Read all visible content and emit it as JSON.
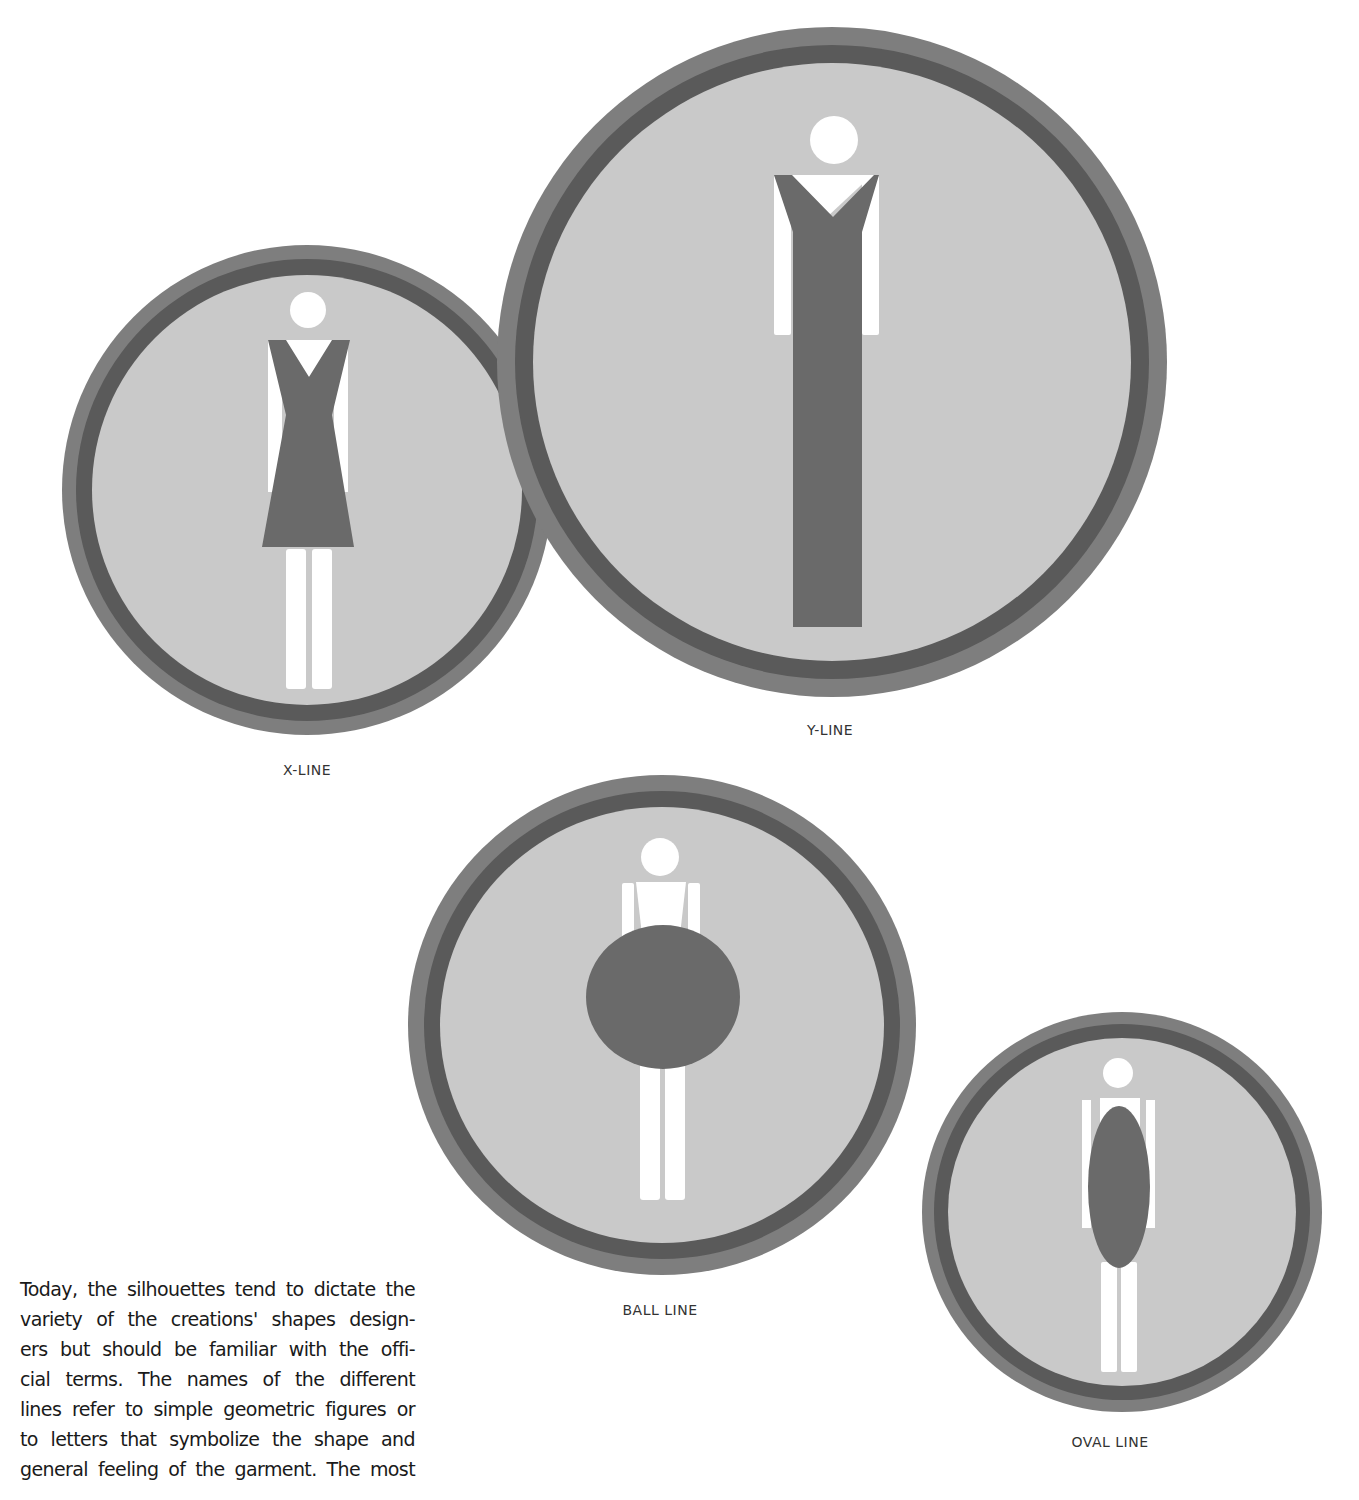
{
  "figures": [
    {
      "id": "x-line",
      "caption": "X-LINE",
      "shape": "A-line dress with V-neck forming an X silhouette",
      "center": [
        307,
        490
      ],
      "radius": 245,
      "caption_pos": [
        307,
        770
      ]
    },
    {
      "id": "y-line",
      "caption": "Y-LINE",
      "shape": "V-neck top flaring into a long straight column forming a Y",
      "center": [
        832,
        362
      ],
      "radius": 335,
      "caption_pos": [
        830,
        730
      ]
    },
    {
      "id": "ball-line",
      "caption": "BALL LINE",
      "shape": "large round circle body over torso",
      "center": [
        660,
        1025
      ],
      "radius": 255,
      "caption_pos": [
        660,
        1308
      ]
    },
    {
      "id": "oval-line",
      "caption": "OVAL LINE",
      "shape": "vertical elongated oval body",
      "center": [
        1122,
        1215
      ],
      "radius": 200,
      "caption_pos": [
        1110,
        1440
      ]
    }
  ],
  "colors": {
    "outer_band": "#7e7e7e",
    "dark_ring": "#5a5a5a",
    "fill": "#c9c9c9",
    "garment": "#6a6a6a",
    "figure": "#ffffff",
    "text": "#1a1a1a"
  },
  "body_text": {
    "lines": [
      "Today, the silhouettes tend to dictate the",
      "variety of the creations' shapes design-",
      "ers but should be familiar with the offi-",
      "cial terms. The names of the different",
      "lines refer to simple geometric figures or",
      "to letters that symbolize the shape and",
      "general feeling of the garment. The most"
    ]
  }
}
